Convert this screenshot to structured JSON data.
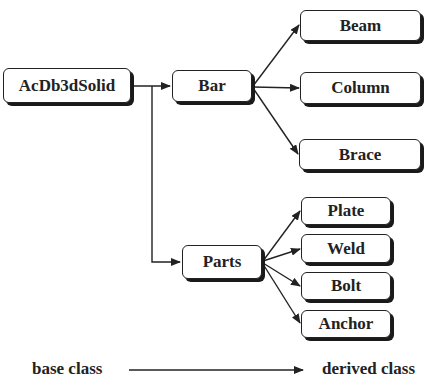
{
  "diagram": {
    "nodes": {
      "root": "AcDb3dSolid",
      "bar": "Bar",
      "parts": "Parts",
      "beam": "Beam",
      "column": "Column",
      "brace": "Brace",
      "plate": "Plate",
      "weld": "Weld",
      "bolt": "Bolt",
      "anchor": "Anchor"
    },
    "edges": [
      [
        "AcDb3dSolid",
        "Bar"
      ],
      [
        "AcDb3dSolid",
        "Parts"
      ],
      [
        "Bar",
        "Beam"
      ],
      [
        "Bar",
        "Column"
      ],
      [
        "Bar",
        "Brace"
      ],
      [
        "Parts",
        "Plate"
      ],
      [
        "Parts",
        "Weld"
      ],
      [
        "Parts",
        "Bolt"
      ],
      [
        "Parts",
        "Anchor"
      ]
    ]
  },
  "legend": {
    "from": "base class",
    "to": "derived class"
  }
}
